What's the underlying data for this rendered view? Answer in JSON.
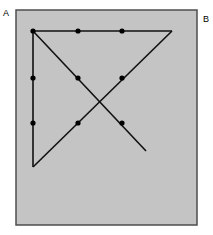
{
  "figure": {
    "canvas": {
      "width": 213,
      "height": 235,
      "background": "#ffffff"
    },
    "panel": {
      "name": "gray-panel",
      "x": 16,
      "y": 10,
      "width": 181,
      "height": 215,
      "fill": "#c4c4c4",
      "stroke": "#4d4d4d",
      "stroke_width": 1.5
    },
    "labels": [
      {
        "id": "A",
        "text": "A",
        "x": 3,
        "y": 9
      },
      {
        "id": "B",
        "text": "B",
        "x": 203,
        "y": 15
      }
    ],
    "stroke_color": "#111111",
    "stroke_width": 1.6,
    "dot_color": "#000000",
    "dot_radius": 2.6,
    "paths": [
      {
        "name": "left-vertical-edge",
        "points": [
          [
            33,
            31
          ],
          [
            33,
            167
          ]
        ]
      },
      {
        "name": "top-horizontal-edge",
        "points": [
          [
            33,
            31
          ],
          [
            172,
            31
          ]
        ]
      },
      {
        "name": "diagonal-top-right-to-bottom-left",
        "points": [
          [
            172,
            31
          ],
          [
            33,
            167
          ]
        ]
      },
      {
        "name": "diagonal-top-left-to-bottom-right",
        "points": [
          [
            33,
            31
          ],
          [
            146,
            151
          ]
        ]
      }
    ],
    "vertices": [
      {
        "name": "vertex-top-left",
        "x": 33,
        "y": 31
      },
      {
        "name": "vertex-top-right",
        "x": 172,
        "y": 31
      },
      {
        "name": "vertex-bottom-left",
        "x": 33,
        "y": 167
      },
      {
        "name": "endpoint-bottom-right",
        "x": 146,
        "y": 151
      },
      {
        "name": "crossing-point",
        "x": 100,
        "y": 100
      }
    ],
    "marked_points": [
      {
        "name": "point-top-left-corner",
        "x": 33,
        "y": 31
      },
      {
        "name": "point-top-mid-left",
        "x": 78,
        "y": 31
      },
      {
        "name": "point-top-mid-right",
        "x": 122,
        "y": 31
      },
      {
        "name": "point-left-upper",
        "x": 33,
        "y": 78
      },
      {
        "name": "point-left-lower",
        "x": 33,
        "y": 123
      },
      {
        "name": "point-inner-upper-left",
        "x": 78,
        "y": 78
      },
      {
        "name": "point-inner-upper-right",
        "x": 122,
        "y": 78
      },
      {
        "name": "point-inner-lower-left",
        "x": 78,
        "y": 123
      },
      {
        "name": "point-inner-lower-right",
        "x": 122,
        "y": 123
      }
    ]
  }
}
